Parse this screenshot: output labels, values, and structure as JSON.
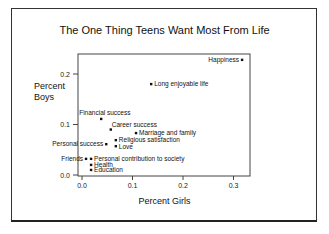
{
  "chart_data": {
    "type": "scatter",
    "title": "The One Thing Teens Want Most From Life",
    "xlabel": "Percent Girls",
    "ylabel": "Percent Boys",
    "xlim": [
      -0.01,
      0.33
    ],
    "ylim": [
      -0.01,
      0.24
    ],
    "xticks": [
      "0.0",
      "0.1",
      "0.2",
      "0.3"
    ],
    "yticks": [
      "0.0",
      "0.1",
      "0.2"
    ],
    "grid": false,
    "legend": null,
    "points": [
      {
        "label": "Happiness",
        "x": 0.317,
        "y": 0.228,
        "label_side": "left"
      },
      {
        "label": "Long enjoyable life",
        "x": 0.137,
        "y": 0.18,
        "label_side": "right"
      },
      {
        "label": "Financial success",
        "x": 0.038,
        "y": 0.111,
        "label_side": "above-left"
      },
      {
        "label": "Career success",
        "x": 0.057,
        "y": 0.09,
        "label_side": "above-right"
      },
      {
        "label": "Marriage and family",
        "x": 0.107,
        "y": 0.083,
        "label_side": "right"
      },
      {
        "label": "Religious satisfaction",
        "x": 0.067,
        "y": 0.069,
        "label_side": "right"
      },
      {
        "label": "Personal success",
        "x": 0.048,
        "y": 0.061,
        "label_side": "left"
      },
      {
        "label": "Love",
        "x": 0.067,
        "y": 0.057,
        "label_side": "right"
      },
      {
        "label": "Friends",
        "x": 0.008,
        "y": 0.032,
        "label_side": "left"
      },
      {
        "label": "Personal contribution to society",
        "x": 0.018,
        "y": 0.032,
        "label_side": "right"
      },
      {
        "label": "Health",
        "x": 0.018,
        "y": 0.02,
        "label_side": "right"
      },
      {
        "label": "Education",
        "x": 0.018,
        "y": 0.01,
        "label_side": "right"
      }
    ]
  }
}
